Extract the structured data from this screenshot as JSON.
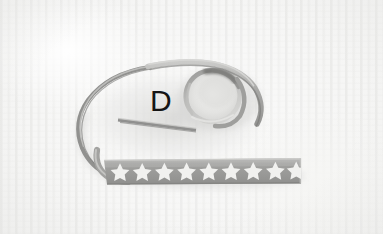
{
  "scene": {
    "width": 383,
    "height": 234,
    "subject": "star-patterned grosgrain ribbon coiled in a loop",
    "surface": "white textured woven fabric"
  },
  "annotation": {
    "label": "D"
  },
  "colors": {
    "background_fabric": "#f6f6f5",
    "fabric_stripe": "#e4e4e2",
    "ribbon_face": "#9a9a9a",
    "ribbon_face_light": "#b4b4b2",
    "ribbon_face_dark": "#7d7d7b",
    "ribbon_edge_shadow": "#6e6e6c",
    "star_white": "#f2f2f0",
    "cast_shadow": "#d8d8d6",
    "annotation_text": "#141414"
  },
  "ribbon": {
    "star_strip": {
      "star_count": 9,
      "star_color": "#f2f2f0",
      "band_color": "#9a9a9a"
    },
    "segments": [
      "flat star-printed band running horizontally at bottom",
      "left sweeping curve rising from band",
      "upper arc crossing to the right",
      "circular curl at right side",
      "short cut tail end inside the loop"
    ]
  }
}
